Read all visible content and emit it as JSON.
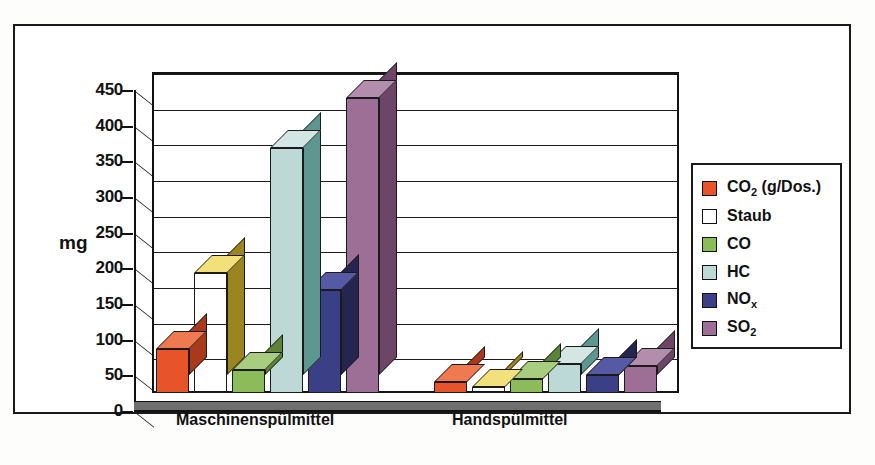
{
  "chart_data": {
    "type": "bar",
    "title": "",
    "xlabel": "",
    "ylabel": "mg",
    "ylim": [
      0,
      450
    ],
    "yticks": [
      0,
      50,
      100,
      150,
      200,
      250,
      300,
      350,
      400,
      450
    ],
    "ytick_labels": [
      "0",
      "50",
      "100",
      "150",
      "200",
      "250",
      "300",
      "350",
      "400",
      "450"
    ],
    "grid": true,
    "legend_position": "right",
    "style": "3d-clustered-column",
    "categories": [
      "Maschinenspülmittel",
      "Handspülmittel"
    ],
    "series": [
      {
        "name": "CO2 (g/Dos.)",
        "label_html": "CO<sub>2</sub> (g/Dos.)",
        "color": "#e8542a",
        "side_color": "#a8391b",
        "top_color": "#f07a50",
        "values": [
          62,
          15
        ]
      },
      {
        "name": "Staub",
        "label_html": "Staub",
        "color": "#f7d councils",
        "side_color": "#9c8520",
        "top_color": "#f2e07a",
        "values": [
          168,
          8
        ]
      },
      {
        "name": "CO",
        "label_html": "CO",
        "color": "#8cbb5a",
        "side_color": "#5d8436",
        "top_color": "#a9cd7e",
        "values": [
          32,
          20
        ]
      },
      {
        "name": "HC",
        "label_html": "HC",
        "color": "#bcd9d6",
        "side_color": "#5e9690",
        "top_color": "#d3e6e4",
        "values": [
          343,
          40
        ]
      },
      {
        "name": "NOx",
        "label_html": "NO<sub>x</sub>",
        "color": "#3b3f86",
        "side_color": "#24264f",
        "top_color": "#565aa5",
        "values": [
          145,
          25
        ]
      },
      {
        "name": "SO2",
        "label_html": "SO<sub>2</sub>",
        "color": "#9d6e96",
        "side_color": "#6d4667",
        "top_color": "#b38dac",
        "values": [
          413,
          38
        ]
      }
    ]
  },
  "legend": {
    "items": [
      {
        "label": "CO2 (g/Dos.)"
      },
      {
        "label": "Staub"
      },
      {
        "label": "CO"
      },
      {
        "label": "HC"
      },
      {
        "label": "NOx"
      },
      {
        "label": "SO2"
      }
    ]
  }
}
